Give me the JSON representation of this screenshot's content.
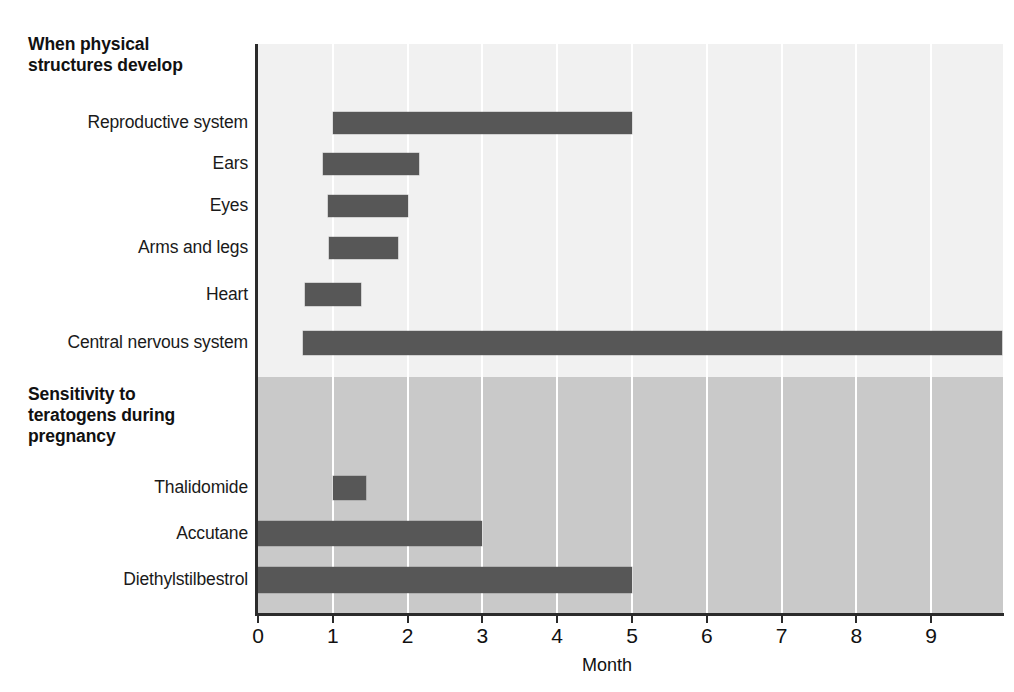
{
  "chart_data": {
    "type": "bar",
    "orientation": "horizontal",
    "title": "",
    "xlabel": "Month",
    "ylabel": "",
    "xlim": [
      0,
      9.95
    ],
    "xticks": [
      "0",
      "1",
      "2",
      "3",
      "4",
      "5",
      "6",
      "7",
      "8",
      "9"
    ],
    "xtick_values": [
      0,
      1,
      2,
      3,
      4,
      5,
      6,
      7,
      8,
      9
    ],
    "grid": "vertical-white-gridlines",
    "legend": "none",
    "colors": {
      "bar": "#575757",
      "upper_panel": "#f1f1f1",
      "lower_panel": "#c9c9c9",
      "gridline": "#ffffff",
      "axis": "#2b2b2b"
    },
    "sections": [
      {
        "heading": "When physical\nstructures develop",
        "panel": "upper",
        "rows": [
          {
            "label": "Reproductive system",
            "start": 1.0,
            "end": 5.0
          },
          {
            "label": "Ears",
            "start": 0.87,
            "end": 2.15
          },
          {
            "label": "Eyes",
            "start": 0.94,
            "end": 2.0
          },
          {
            "label": "Arms and legs",
            "start": 0.95,
            "end": 1.87
          },
          {
            "label": "Heart",
            "start": 0.63,
            "end": 1.38
          },
          {
            "label": "Central nervous system",
            "start": 0.6,
            "end": 9.95
          }
        ]
      },
      {
        "heading": "Sensitivity to\nteratogens during\npregnancy",
        "panel": "lower",
        "rows": [
          {
            "label": "Thalidomide",
            "start": 1.0,
            "end": 1.45
          },
          {
            "label": "Accutane",
            "start": 0.0,
            "end": 3.0
          },
          {
            "label": "Diethylstilbestrol",
            "start": 0.0,
            "end": 5.0
          }
        ]
      }
    ]
  },
  "headings": {
    "physical": "When physical\nstructures develop",
    "teratogens": "Sensitivity to\nteratogens during\npregnancy"
  },
  "row_labels": {
    "reproductive_system": "Reproductive system",
    "ears": "Ears",
    "eyes": "Eyes",
    "arms_and_legs": "Arms and legs",
    "heart": "Heart",
    "central_nervous_system": "Central nervous system",
    "thalidomide": "Thalidomide",
    "accutane": "Accutane",
    "diethylstilbestrol": "Diethylstilbestrol"
  },
  "axis": {
    "title": "Month",
    "ticks": [
      "0",
      "1",
      "2",
      "3",
      "4",
      "5",
      "6",
      "7",
      "8",
      "9"
    ]
  }
}
